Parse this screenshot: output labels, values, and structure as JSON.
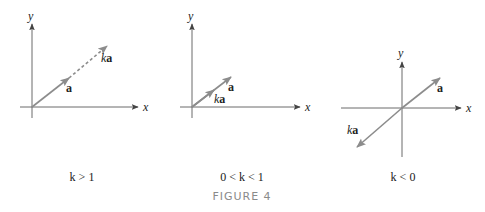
{
  "figure": {
    "title": "FIGURE 4",
    "panels": [
      {
        "id": "k-greater-than-1",
        "caption": "k > 1",
        "axis_labels": {
          "x": "x",
          "y": "y"
        },
        "vectors": [
          {
            "label": "a",
            "style": "solid"
          },
          {
            "label": "ka",
            "style": "dashed-extension"
          }
        ]
      },
      {
        "id": "k-between-0-and-1",
        "caption": "0 < k < 1",
        "axis_labels": {
          "x": "x",
          "y": "y"
        },
        "vectors": [
          {
            "label": "a",
            "style": "solid"
          },
          {
            "label": "ka",
            "style": "solid-shorter"
          }
        ]
      },
      {
        "id": "k-less-than-0",
        "caption": "k < 0",
        "axis_labels": {
          "x": "x",
          "y": "y"
        },
        "vectors": [
          {
            "label": "a",
            "style": "solid"
          },
          {
            "label": "ka",
            "style": "solid-opposite"
          }
        ]
      }
    ],
    "colors": {
      "axis": "#6b6b6b",
      "vector": "#8c8c8c",
      "label": "#222222",
      "title": "#8a8a8a"
    }
  }
}
